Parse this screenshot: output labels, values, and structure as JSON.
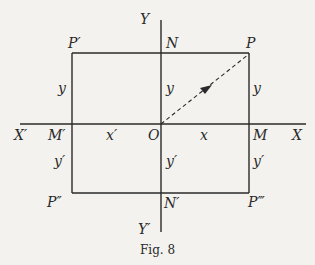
{
  "figure": {
    "caption": "Fig. 8",
    "axes": {
      "x_pos_label": "X",
      "x_neg_label": "X′",
      "y_pos_label": "Y",
      "y_neg_label": "Y′",
      "origin_label": "O"
    },
    "points": {
      "P": "P",
      "P1": "P′",
      "P2": "P″",
      "P3": "P‴",
      "M": "M",
      "M1": "M′",
      "N": "N",
      "N1": "N′"
    },
    "segments": {
      "x": "x",
      "x1": "x′",
      "y_left_upper": "y",
      "y_mid_upper": "y",
      "y_right_upper": "y",
      "y_left_lower": "y′",
      "y_mid_lower": "y′",
      "y_right_lower": "y′"
    },
    "colors": {
      "ink": "#2a2a2a",
      "paper": "#f3f2ee"
    }
  }
}
